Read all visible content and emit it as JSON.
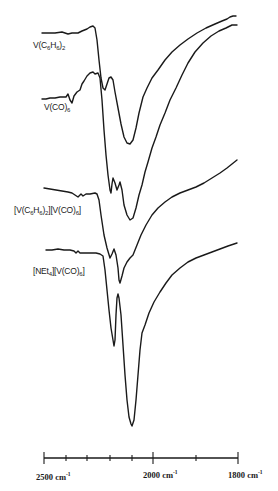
{
  "chart_data": {
    "type": "line",
    "title": "",
    "xlabel": "wavenumber (cm-1)",
    "ylabel": "",
    "x_direction": "decreasing (left to right)",
    "axis": {
      "ticks": [
        {
          "label": "2500 cm-1",
          "value": 2500,
          "px": 44
        },
        {
          "label": "",
          "value": 2450,
          "px": 66
        },
        {
          "label": "",
          "value": 2400,
          "px": 87
        },
        {
          "label": "",
          "value": 2350,
          "px": 110
        },
        {
          "label": "",
          "value": 2300,
          "px": 132
        },
        {
          "label": "2000 cm-1",
          "value": 2000,
          "px": 153
        },
        {
          "label": "",
          "value": 1900,
          "px": 196
        },
        {
          "label": "1800 cm-1",
          "value": 1800,
          "px": 238
        }
      ],
      "labeled": [
        "2500",
        "2000",
        "1800"
      ],
      "unit": "cm-1"
    },
    "grid": false,
    "legend": "inline labels left of each trace",
    "series": [
      {
        "name": "V(C6H6)2",
        "label_parts": [
          [
            "V(C",
            ""
          ],
          [
            "6",
            "sub"
          ],
          [
            "H",
            ""
          ],
          [
            "6",
            "sub"
          ],
          [
            ")",
            ""
          ],
          [
            "2",
            "sub"
          ]
        ],
        "label_pos": [
          33,
          40
        ],
        "approx_minima_cm-1": [
          2115
        ],
        "path": [
          [
            42,
            33
          ],
          [
            48,
            33
          ],
          [
            55,
            33
          ],
          [
            62,
            32
          ],
          [
            68,
            34
          ],
          [
            72,
            33
          ],
          [
            78,
            33
          ],
          [
            82,
            31
          ],
          [
            87,
            29
          ],
          [
            90,
            27
          ],
          [
            93,
            26
          ],
          [
            95,
            28
          ],
          [
            97,
            40
          ],
          [
            99,
            60
          ],
          [
            101,
            78
          ],
          [
            103,
            88
          ],
          [
            105,
            90
          ],
          [
            107,
            84
          ],
          [
            109,
            78
          ],
          [
            111,
            77
          ],
          [
            113,
            80
          ],
          [
            115,
            92
          ],
          [
            118,
            108
          ],
          [
            121,
            124
          ],
          [
            124,
            137
          ],
          [
            127,
            143
          ],
          [
            130,
            144
          ],
          [
            133,
            140
          ],
          [
            136,
            128
          ],
          [
            139,
            113
          ],
          [
            143,
            97
          ],
          [
            147,
            88
          ],
          [
            152,
            78
          ],
          [
            158,
            70
          ],
          [
            165,
            60
          ],
          [
            172,
            52
          ],
          [
            180,
            45
          ],
          [
            188,
            39
          ],
          [
            197,
            33
          ],
          [
            206,
            28
          ],
          [
            215,
            24
          ],
          [
            222,
            21
          ],
          [
            227,
            19
          ],
          [
            230,
            17
          ],
          [
            233,
            16
          ],
          [
            236,
            16
          ]
        ]
      },
      {
        "name": "V(CO)6",
        "label_parts": [
          [
            "V(CO)",
            ""
          ],
          [
            "6",
            "sub"
          ]
        ],
        "label_pos": [
          44,
          102
        ],
        "approx_minima_cm-1": [
          2100
        ],
        "path": [
          [
            42,
            99
          ],
          [
            46,
            99
          ],
          [
            50,
            98
          ],
          [
            55,
            98
          ],
          [
            60,
            97
          ],
          [
            66,
            97
          ],
          [
            68,
            94
          ],
          [
            70,
            100
          ],
          [
            72,
            103
          ],
          [
            74,
            96
          ],
          [
            77,
            92
          ],
          [
            80,
            90
          ],
          [
            82,
            84
          ],
          [
            84,
            81
          ],
          [
            87,
            76
          ],
          [
            90,
            73
          ],
          [
            93,
            72
          ],
          [
            95,
            74
          ],
          [
            98,
            73
          ],
          [
            100,
            78
          ],
          [
            102,
            100
          ],
          [
            104,
            130
          ],
          [
            106,
            155
          ],
          [
            108,
            175
          ],
          [
            110,
            190
          ],
          [
            111,
            193
          ],
          [
            112,
            184
          ],
          [
            113,
            178
          ],
          [
            115,
            183
          ],
          [
            117,
            190
          ],
          [
            119,
            185
          ],
          [
            120,
            182
          ],
          [
            122,
            190
          ],
          [
            124,
            205
          ],
          [
            127,
            215
          ],
          [
            130,
            220
          ],
          [
            133,
            218
          ],
          [
            136,
            208
          ],
          [
            139,
            195
          ],
          [
            142,
            185
          ],
          [
            145,
            172
          ],
          [
            148,
            162
          ],
          [
            152,
            148
          ],
          [
            156,
            137
          ],
          [
            160,
            125
          ],
          [
            165,
            113
          ],
          [
            170,
            100
          ],
          [
            176,
            88
          ],
          [
            182,
            75
          ],
          [
            188,
            63
          ],
          [
            195,
            52
          ],
          [
            203,
            43
          ],
          [
            211,
            36
          ],
          [
            219,
            31
          ],
          [
            226,
            28
          ],
          [
            232,
            25
          ],
          [
            237,
            25
          ]
        ]
      },
      {
        "name": "[V(C6H6)2][V(CO)6]",
        "label_parts": [
          [
            "[V(C",
            ""
          ],
          [
            "6",
            "sub"
          ],
          [
            "H",
            ""
          ],
          [
            "6",
            "sub"
          ],
          [
            ")",
            ""
          ],
          [
            "2",
            "sub"
          ],
          [
            "][V(CO)",
            ""
          ],
          [
            "6",
            "sub"
          ],
          [
            "]",
            ""
          ]
        ],
        "label_pos": [
          14,
          205
        ],
        "approx_minima_cm-1": [
          2180,
          2155
        ],
        "path": [
          [
            44,
            188
          ],
          [
            50,
            189
          ],
          [
            56,
            190
          ],
          [
            62,
            191
          ],
          [
            68,
            192
          ],
          [
            72,
            193
          ],
          [
            75,
            195
          ],
          [
            78,
            197
          ],
          [
            81,
            194
          ],
          [
            83,
            196
          ],
          [
            86,
            194
          ],
          [
            90,
            194
          ],
          [
            95,
            193
          ],
          [
            97,
            194
          ],
          [
            99,
            200
          ],
          [
            101,
            215
          ],
          [
            104,
            235
          ],
          [
            107,
            248
          ],
          [
            110,
            258
          ],
          [
            112,
            254
          ],
          [
            114,
            249
          ],
          [
            116,
            255
          ],
          [
            118,
            268
          ],
          [
            119,
            280
          ],
          [
            120,
            283
          ],
          [
            122,
            276
          ],
          [
            124,
            268
          ],
          [
            127,
            262
          ],
          [
            130,
            258
          ],
          [
            133,
            255
          ],
          [
            137,
            245
          ],
          [
            141,
            235
          ],
          [
            146,
            225
          ],
          [
            152,
            215
          ],
          [
            158,
            208
          ],
          [
            165,
            202
          ],
          [
            172,
            197
          ],
          [
            180,
            193
          ],
          [
            188,
            190
          ],
          [
            196,
            187
          ],
          [
            204,
            183
          ],
          [
            212,
            178
          ],
          [
            220,
            173
          ],
          [
            227,
            168
          ],
          [
            232,
            164
          ],
          [
            237,
            160
          ]
        ]
      },
      {
        "name": "[NEt4][V(CO)6]",
        "label_parts": [
          [
            "[NEt",
            ""
          ],
          [
            "4",
            "sub"
          ],
          [
            "][V(CO)",
            ""
          ],
          [
            "6",
            "sub"
          ],
          [
            "]",
            ""
          ]
        ],
        "label_pos": [
          33,
          266
        ],
        "approx_minima_cm-1": [
          2180,
          2095
        ],
        "path": [
          [
            46,
            250
          ],
          [
            52,
            250
          ],
          [
            58,
            249
          ],
          [
            64,
            250
          ],
          [
            70,
            250
          ],
          [
            74,
            251
          ],
          [
            76,
            253
          ],
          [
            78,
            251
          ],
          [
            80,
            253
          ],
          [
            84,
            253
          ],
          [
            90,
            253
          ],
          [
            96,
            253
          ],
          [
            100,
            254
          ],
          [
            103,
            256
          ],
          [
            105,
            270
          ],
          [
            107,
            290
          ],
          [
            109,
            310
          ],
          [
            111,
            328
          ],
          [
            113,
            340
          ],
          [
            114,
            346
          ],
          [
            115,
            340
          ],
          [
            116,
            315
          ],
          [
            117,
            298
          ],
          [
            118,
            294
          ],
          [
            119,
            298
          ],
          [
            121,
            315
          ],
          [
            123,
            345
          ],
          [
            125,
            375
          ],
          [
            127,
            400
          ],
          [
            129,
            417
          ],
          [
            131,
            424
          ],
          [
            132,
            426
          ],
          [
            134,
            420
          ],
          [
            136,
            400
          ],
          [
            138,
            375
          ],
          [
            140,
            350
          ],
          [
            142,
            333
          ],
          [
            145,
            325
          ],
          [
            149,
            313
          ],
          [
            154,
            302
          ],
          [
            160,
            292
          ],
          [
            166,
            283
          ],
          [
            172,
            275
          ],
          [
            180,
            268
          ],
          [
            188,
            262
          ],
          [
            196,
            258
          ],
          [
            204,
            255
          ],
          [
            212,
            252
          ],
          [
            220,
            249
          ],
          [
            228,
            246
          ],
          [
            234,
            244
          ],
          [
            237,
            243
          ]
        ]
      }
    ]
  },
  "axis_labels": {
    "left": {
      "num": "2500 cm",
      "sup": "-1"
    },
    "mid": {
      "num": "2000 cm",
      "sup": "-1"
    },
    "right": {
      "num": "1800 cm",
      "sup": "-1"
    }
  },
  "colors": {
    "ink": "#1a1a1a",
    "background": "#ffffff"
  }
}
